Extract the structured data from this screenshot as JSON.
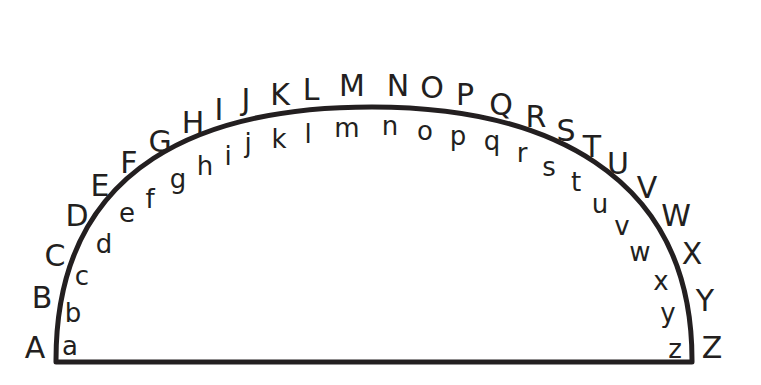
{
  "diagram": {
    "stroke_color": "#231f20",
    "arc": {
      "start": [
        55,
        360
      ],
      "end": [
        693,
        360
      ],
      "peak_y": 107
    },
    "uppercase": [
      {
        "ch": "A",
        "x": 35,
        "y": 358
      },
      {
        "ch": "B",
        "x": 42,
        "y": 308
      },
      {
        "ch": "C",
        "x": 55,
        "y": 266
      },
      {
        "ch": "D",
        "x": 77,
        "y": 226
      },
      {
        "ch": "E",
        "x": 100,
        "y": 196
      },
      {
        "ch": "F",
        "x": 129,
        "y": 173
      },
      {
        "ch": "G",
        "x": 160,
        "y": 152
      },
      {
        "ch": "H",
        "x": 193,
        "y": 133
      },
      {
        "ch": "I",
        "x": 219,
        "y": 120
      },
      {
        "ch": "J",
        "x": 246,
        "y": 110
      },
      {
        "ch": "K",
        "x": 280,
        "y": 105
      },
      {
        "ch": "L",
        "x": 311,
        "y": 100
      },
      {
        "ch": "M",
        "x": 352,
        "y": 96
      },
      {
        "ch": "N",
        "x": 398,
        "y": 96
      },
      {
        "ch": "O",
        "x": 432,
        "y": 98
      },
      {
        "ch": "P",
        "x": 465,
        "y": 105
      },
      {
        "ch": "Q",
        "x": 501,
        "y": 115
      },
      {
        "ch": "R",
        "x": 536,
        "y": 127
      },
      {
        "ch": "S",
        "x": 566,
        "y": 141
      },
      {
        "ch": "T",
        "x": 592,
        "y": 157
      },
      {
        "ch": "U",
        "x": 618,
        "y": 174
      },
      {
        "ch": "V",
        "x": 647,
        "y": 198
      },
      {
        "ch": "W",
        "x": 676,
        "y": 226
      },
      {
        "ch": "X",
        "x": 692,
        "y": 264
      },
      {
        "ch": "Y",
        "x": 705,
        "y": 311
      },
      {
        "ch": "Z",
        "x": 712,
        "y": 358
      }
    ],
    "lowercase": [
      {
        "ch": "a",
        "x": 70,
        "y": 355
      },
      {
        "ch": "b",
        "x": 73,
        "y": 322
      },
      {
        "ch": "c",
        "x": 82,
        "y": 285
      },
      {
        "ch": "d",
        "x": 104,
        "y": 253
      },
      {
        "ch": "e",
        "x": 127,
        "y": 222
      },
      {
        "ch": "f",
        "x": 150,
        "y": 208
      },
      {
        "ch": "g",
        "x": 178,
        "y": 188
      },
      {
        "ch": "h",
        "x": 205,
        "y": 175
      },
      {
        "ch": "i",
        "x": 228,
        "y": 165
      },
      {
        "ch": "j",
        "x": 248,
        "y": 152
      },
      {
        "ch": "k",
        "x": 279,
        "y": 148
      },
      {
        "ch": "l",
        "x": 308,
        "y": 143
      },
      {
        "ch": "m",
        "x": 347,
        "y": 137
      },
      {
        "ch": "n",
        "x": 390,
        "y": 135
      },
      {
        "ch": "o",
        "x": 425,
        "y": 140
      },
      {
        "ch": "p",
        "x": 458,
        "y": 145
      },
      {
        "ch": "q",
        "x": 492,
        "y": 150
      },
      {
        "ch": "r",
        "x": 522,
        "y": 162
      },
      {
        "ch": "s",
        "x": 549,
        "y": 176
      },
      {
        "ch": "t",
        "x": 576,
        "y": 191
      },
      {
        "ch": "u",
        "x": 600,
        "y": 213
      },
      {
        "ch": "v",
        "x": 622,
        "y": 235
      },
      {
        "ch": "w",
        "x": 640,
        "y": 261
      },
      {
        "ch": "x",
        "x": 661,
        "y": 290
      },
      {
        "ch": "y",
        "x": 668,
        "y": 322
      },
      {
        "ch": "z",
        "x": 675,
        "y": 358
      }
    ]
  }
}
